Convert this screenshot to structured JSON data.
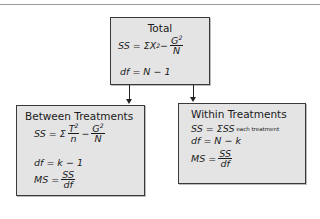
{
  "diagram": {
    "total": {
      "title": "Total",
      "ss_lhs": "SS = ΣX",
      "ss_exp": "2",
      "ss_minus": " − ",
      "ss_frac_num": "G",
      "ss_frac_num_exp": "2",
      "ss_frac_den": "N",
      "df": "df = N − 1"
    },
    "between": {
      "title": "Between Treatments",
      "ss_lhs": "SS = Σ",
      "t_num": "T",
      "t_exp": "2",
      "t_den": "n",
      "minus": " − ",
      "g_num": "G",
      "g_exp": "2",
      "g_den": "N",
      "df": "df = k − 1",
      "ms_lhs": "MS = ",
      "ms_num": "SS",
      "ms_den": "df"
    },
    "within": {
      "title": "Within Treatments",
      "ss": "SS = ΣSS",
      "ss_sub": "each treatment",
      "df": "df = N − k",
      "ms_lhs": "MS = ",
      "ms_num": "SS",
      "ms_den": "df"
    },
    "edges": [
      {
        "from": "Total",
        "to": "Between Treatments"
      },
      {
        "from": "Total",
        "to": "Within Treatments"
      }
    ]
  }
}
